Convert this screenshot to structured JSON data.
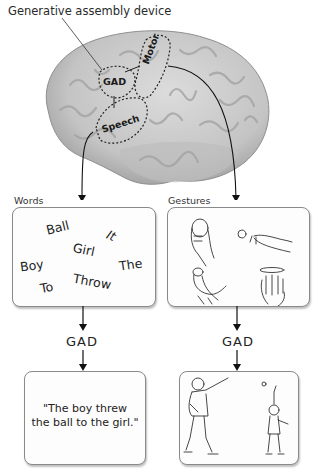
{
  "title": "Generative assembly device",
  "brain": {
    "regions": [
      {
        "id": "gad",
        "label": "GAD"
      },
      {
        "id": "motor",
        "label": "Motor"
      },
      {
        "id": "speech",
        "label": "Speech"
      }
    ]
  },
  "left_column": {
    "panel_label": "Words",
    "words": [
      "Ball",
      "It",
      "Girl",
      "Boy",
      "The",
      "To",
      "Throw"
    ],
    "process_label": "GAD",
    "output_lines": [
      "\"The boy threw",
      "the ball to the girl.\""
    ]
  },
  "right_column": {
    "panel_label": "Gestures",
    "gesture_icons": [
      "hand-holding-ball",
      "hand-releasing-ball",
      "hand-raising-ball",
      "hand-rotating"
    ],
    "process_label": "GAD",
    "output_scene": "boy-throws-ball-to-girl"
  },
  "colors": {
    "brain_fill": "#c9c9c9",
    "box_border": "#8a8a8a",
    "text": "#222222"
  }
}
